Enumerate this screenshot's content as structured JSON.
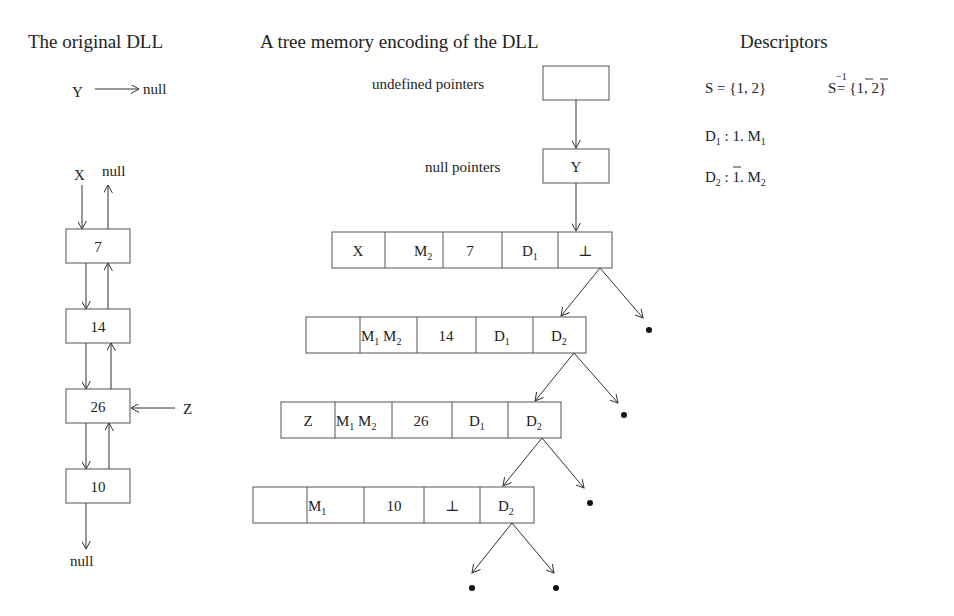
{
  "headings": {
    "left": "The original DLL",
    "middle": "A tree memory encoding of the DLL",
    "right": "Descriptors"
  },
  "dll": {
    "y_label": "Y",
    "y_null": "null",
    "x_label": "X",
    "top_null": "null",
    "nodes": [
      "7",
      "14",
      "26",
      "10"
    ],
    "z_label": "Z",
    "bottom_null": "null"
  },
  "tree": {
    "undefined_label": "undefined pointers",
    "null_label": "null pointers",
    "null_box": "Y",
    "rows": [
      {
        "vars": "X",
        "marks": [
          "",
          "M2"
        ],
        "value": "7",
        "left": "D1",
        "right": "⊥"
      },
      {
        "vars": "",
        "marks": [
          "M1",
          "M2"
        ],
        "value": "14",
        "left": "D1",
        "right": "D2"
      },
      {
        "vars": "Z",
        "marks": [
          "M1",
          "M2"
        ],
        "value": "26",
        "left": "D1",
        "right": "D2"
      },
      {
        "vars": "",
        "marks": [
          "M1",
          ""
        ],
        "value": "10",
        "left": "⊥",
        "right": "D2"
      }
    ]
  },
  "descriptors": {
    "s": "S = {1, 2}",
    "s_inv": "S⁻¹ = {1̄, 2̄}",
    "d1": "D1 : 1. M1",
    "d2": "D2 : 1̄. M2"
  }
}
